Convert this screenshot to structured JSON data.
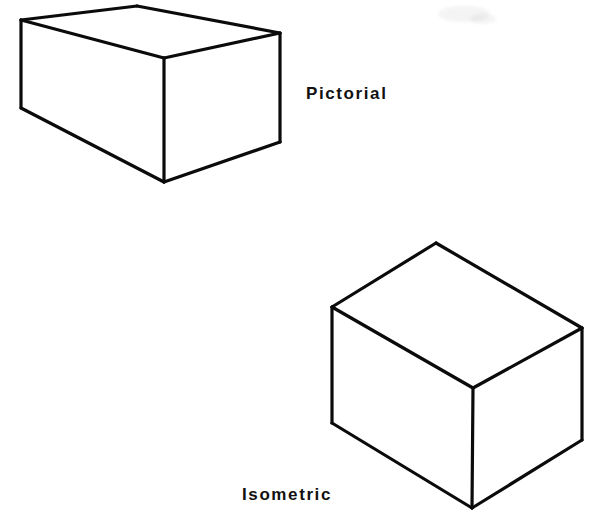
{
  "page": {
    "background_color": "#ffffff",
    "ink_color": "#0b0b0b",
    "width": 612,
    "height": 527
  },
  "labels": {
    "pictorial": "Pictorial",
    "isometric": "Isometric"
  },
  "figures": [
    {
      "id": "pictorial-box",
      "name": "pictorial-box",
      "label": "Pictorial",
      "shape": "rectangular-box",
      "description": "Line drawing of a rectangular box in pictorial (perspective) projection, viewed from above-left.",
      "vertices": {
        "top_back_left": [
          21,
          20
        ],
        "top_back_apex": [
          137,
          6
        ],
        "top_back_right": [
          280,
          33
        ],
        "top_front_center": [
          164,
          58
        ],
        "bottom_front_left": [
          21,
          108
        ],
        "bottom_front_center": [
          164,
          182
        ],
        "bottom_front_right": [
          280,
          142
        ]
      },
      "faces": [
        {
          "name": "top-face",
          "points": "21,20 137,6 280,33 164,58"
        },
        {
          "name": "left-face",
          "points": "21,20 164,58 164,182 21,108"
        },
        {
          "name": "right-face",
          "points": "164,58 280,33 280,142 164,182"
        }
      ],
      "edges": [
        {
          "name": "top-back-left-edge",
          "from": [
            21,
            20
          ],
          "to": [
            137,
            6
          ]
        },
        {
          "name": "top-back-right-edge",
          "from": [
            137,
            6
          ],
          "to": [
            280,
            33
          ]
        },
        {
          "name": "top-front-right-edge",
          "from": [
            280,
            33
          ],
          "to": [
            164,
            58
          ]
        },
        {
          "name": "top-front-left-edge",
          "from": [
            164,
            58
          ],
          "to": [
            21,
            20
          ]
        },
        {
          "name": "left-vertical-edge",
          "from": [
            21,
            20
          ],
          "to": [
            21,
            108
          ]
        },
        {
          "name": "front-vertical-edge",
          "from": [
            164,
            58
          ],
          "to": [
            164,
            182
          ]
        },
        {
          "name": "right-vertical-edge",
          "from": [
            280,
            33
          ],
          "to": [
            280,
            142
          ]
        },
        {
          "name": "bottom-left-edge",
          "from": [
            21,
            108
          ],
          "to": [
            164,
            182
          ]
        },
        {
          "name": "bottom-right-edge",
          "from": [
            164,
            182
          ],
          "to": [
            280,
            142
          ]
        }
      ]
    },
    {
      "id": "isometric-cube",
      "name": "isometric-cube",
      "label": "Isometric",
      "shape": "rectangular-box",
      "description": "Line drawing of a rectangular box in isometric projection with 30-degree receding axes.",
      "vertices": {
        "top_apex": [
          436,
          243
        ],
        "top_left": [
          332,
          307
        ],
        "top_right": [
          582,
          328
        ],
        "top_front_center": [
          473,
          388
        ],
        "bottom_left": [
          332,
          423
        ],
        "bottom_front_center": [
          472,
          508
        ],
        "bottom_right": [
          582,
          440
        ]
      },
      "faces": [
        {
          "name": "top-face",
          "points": "436,243 582,328 473,388 332,307"
        },
        {
          "name": "left-face",
          "points": "332,307 473,388 472,508 332,423"
        },
        {
          "name": "right-face",
          "points": "473,388 582,328 582,440 472,508"
        }
      ],
      "edges": [
        {
          "name": "top-back-left-edge",
          "from": [
            332,
            307
          ],
          "to": [
            436,
            243
          ]
        },
        {
          "name": "top-back-right-edge",
          "from": [
            436,
            243
          ],
          "to": [
            582,
            328
          ]
        },
        {
          "name": "top-front-right-edge",
          "from": [
            582,
            328
          ],
          "to": [
            473,
            388
          ]
        },
        {
          "name": "top-front-left-edge",
          "from": [
            473,
            388
          ],
          "to": [
            332,
            307
          ]
        },
        {
          "name": "left-vertical-edge",
          "from": [
            332,
            307
          ],
          "to": [
            332,
            423
          ]
        },
        {
          "name": "front-vertical-edge",
          "from": [
            473,
            388
          ],
          "to": [
            472,
            508
          ]
        },
        {
          "name": "right-vertical-edge",
          "from": [
            582,
            328
          ],
          "to": [
            582,
            440
          ]
        },
        {
          "name": "bottom-left-edge",
          "from": [
            332,
            423
          ],
          "to": [
            472,
            508
          ]
        },
        {
          "name": "bottom-right-edge",
          "from": [
            472,
            508
          ],
          "to": [
            582,
            440
          ]
        }
      ]
    }
  ]
}
